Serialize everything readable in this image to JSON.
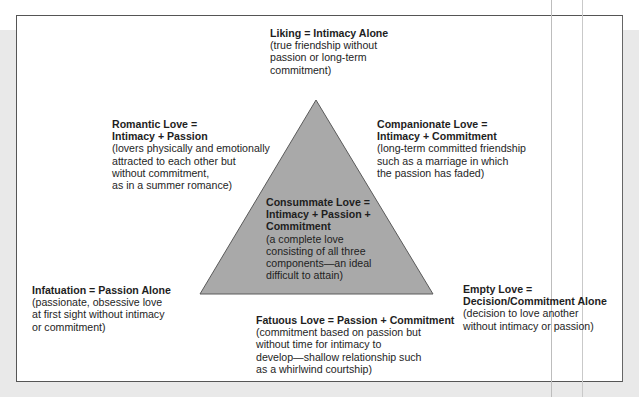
{
  "diagram": {
    "type": "triangle-of-love",
    "triangle_fill": "#a9a9a9",
    "triangle_stroke": "#5a5a5a",
    "center": {
      "title_lines": [
        "Consummate Love =",
        "Intimacy + Passion +",
        "Commitment"
      ],
      "desc_lines": [
        "(a complete love",
        "consisting of all three",
        "components—an ideal",
        "difficult to attain)"
      ]
    },
    "liking": {
      "title_lines": [
        "Liking = Intimacy Alone"
      ],
      "desc_lines": [
        "(true friendship without",
        "passion or long-term",
        "commitment)"
      ]
    },
    "romantic": {
      "title_lines": [
        "Romantic Love =",
        "Intimacy + Passion"
      ],
      "desc_lines": [
        "(lovers physically and emotionally",
        "attracted to each other but",
        "without commitment,",
        "as in a summer romance)"
      ]
    },
    "companionate": {
      "title_lines": [
        "Companionate Love =",
        "Intimacy + Commitment"
      ],
      "desc_lines": [
        "(long-term committed friendship",
        "such as a marriage in which",
        "the passion has faded)"
      ]
    },
    "infatuation": {
      "title_lines": [
        "Infatuation = Passion Alone"
      ],
      "desc_lines": [
        "(passionate, obsessive love",
        "at first sight without intimacy",
        "or commitment)"
      ]
    },
    "fatuous": {
      "title_lines": [
        "Fatuous Love = Passion + Commitment"
      ],
      "desc_lines": [
        "(commitment based on passion but",
        "without time for intimacy to",
        "develop—shallow relationship such",
        "as a whirlwind courtship)"
      ]
    },
    "empty": {
      "title_lines": [
        "Empty Love =",
        "Decision/Commitment Alone"
      ],
      "desc_lines": [
        "(decision to love another",
        "without intimacy or passion)"
      ]
    }
  }
}
